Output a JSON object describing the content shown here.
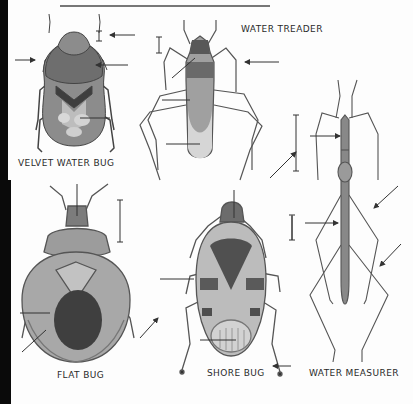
{
  "plate": {
    "background": "#fdfdfd",
    "ink": "#3a3a3a",
    "specimens": [
      {
        "id": "velvet-water-bug",
        "label": "VELVET WATER BUG",
        "label_pos": [
          18,
          162
        ]
      },
      {
        "id": "water-treader",
        "label": "WATER TREADER",
        "label_pos": [
          241,
          27
        ]
      },
      {
        "id": "flat-bug",
        "label": "FLAT BUG",
        "label_pos": [
          57,
          373
        ]
      },
      {
        "id": "shore-bug",
        "label": "SHORE BUG",
        "label_pos": [
          207,
          371
        ]
      },
      {
        "id": "water-measurer",
        "label": "WATER MEASURER",
        "label_pos": [
          309,
          371
        ]
      }
    ]
  },
  "labels": {
    "velvet_water_bug": "VELVET WATER BUG",
    "water_treader": "WATER TREADER",
    "flat_bug": "FLAT BUG",
    "shore_bug": "SHORE BUG",
    "water_measurer": "WATER MEASURER"
  }
}
